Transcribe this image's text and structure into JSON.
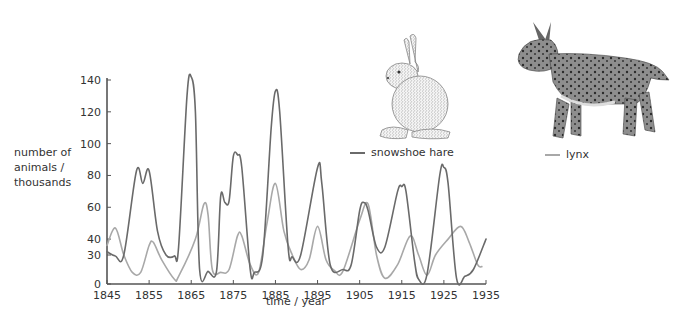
{
  "chart_data": {
    "type": "line",
    "title": "",
    "xlabel": "time / year",
    "ylabel": "number of animals / thousands",
    "ylabel_lines": [
      "number of",
      "animals /",
      "thousands"
    ],
    "xlim": [
      1845,
      1935
    ],
    "ylim": [
      0,
      140
    ],
    "x_ticks": [
      1845,
      1855,
      1865,
      1875,
      1885,
      1895,
      1905,
      1915,
      1925,
      1935
    ],
    "y_ticks": [
      0,
      30,
      40,
      60,
      80,
      100,
      120,
      140
    ],
    "grid": false,
    "legend_position": "inline, beside illustrations (upper right)",
    "series": [
      {
        "name": "snowshoe hare",
        "color": "#6a6a6a",
        "x": [
          1845,
          1847,
          1849,
          1852,
          1853.5,
          1855,
          1857,
          1859,
          1861,
          1862,
          1864,
          1865,
          1866,
          1867,
          1869,
          1871,
          1872,
          1873,
          1874,
          1875,
          1876,
          1877,
          1879,
          1880,
          1882,
          1884,
          1885,
          1886,
          1888,
          1889,
          1891,
          1895,
          1896,
          1898,
          1901,
          1903,
          1905,
          1906,
          1907,
          1909,
          1911,
          1914,
          1915,
          1916,
          1918,
          1919,
          1921,
          1924,
          1925,
          1926,
          1928,
          1930,
          1932,
          1935
        ],
        "values": [
          32,
          29,
          30,
          83,
          75,
          83,
          45,
          30,
          29,
          35,
          130,
          142,
          120,
          15,
          13,
          13,
          67,
          63,
          64,
          92,
          93,
          85,
          15,
          12,
          30,
          110,
          133,
          120,
          35,
          28,
          30,
          85,
          75,
          20,
          15,
          20,
          58,
          63,
          58,
          35,
          35,
          70,
          73,
          70,
          25,
          5,
          10,
          80,
          85,
          75,
          6,
          8,
          15,
          40
        ]
      },
      {
        "name": "lynx",
        "color": "#a8a8a8",
        "x": [
          1845,
          1847,
          1849,
          1851,
          1853,
          1855,
          1856,
          1858,
          1861,
          1862,
          1866,
          1868,
          1869,
          1870,
          1872,
          1874,
          1876,
          1877,
          1879,
          1881,
          1883,
          1885,
          1887,
          1889,
          1891,
          1893,
          1895,
          1897,
          1899,
          1901,
          1905,
          1907,
          1909,
          1911,
          1914,
          1917,
          1919,
          1921,
          1923,
          1926,
          1929,
          1931,
          1933,
          1934
        ],
        "values": [
          36,
          47,
          30,
          12,
          12,
          36,
          38,
          25,
          5,
          8,
          40,
          62,
          55,
          15,
          12,
          15,
          42,
          42,
          20,
          12,
          50,
          75,
          45,
          30,
          15,
          25,
          48,
          25,
          14,
          13,
          52,
          62,
          30,
          6,
          20,
          42,
          30,
          9,
          30,
          40,
          48,
          38,
          20,
          18
        ]
      }
    ]
  },
  "legend": {
    "hare_label": "snowshoe hare",
    "lynx_label": "lynx"
  },
  "illustrations": {
    "hare": "snowshoe-hare-drawing",
    "lynx": "lynx-drawing"
  },
  "colors": {
    "axis": "#555555",
    "hare_line": "#6a6a6a",
    "lynx_line": "#a8a8a8"
  }
}
